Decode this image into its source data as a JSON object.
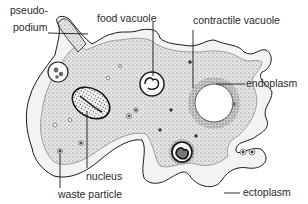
{
  "diagram": {
    "labels": [
      {
        "id": "pseudopodium-1",
        "text": "pseudo-"
      },
      {
        "id": "pseudopodium-2",
        "text": "podium"
      },
      {
        "id": "food-vacuole",
        "text": "food vacuole"
      },
      {
        "id": "contractile-vacuole",
        "text": "contractile vacuole"
      },
      {
        "id": "endoplasm",
        "text": "endoplasm"
      },
      {
        "id": "nucleus",
        "text": "nucleus"
      },
      {
        "id": "waste-particle",
        "text": "waste particle"
      },
      {
        "id": "ectoplasm",
        "text": "ectoplasm"
      }
    ],
    "colors": {
      "ink": "#1a1a1a",
      "label": "#2a2a2a",
      "ectoplasm_fill": "#f4f4f4",
      "endoplasm_fill": "#d9d9d9",
      "background": "#ffffff"
    }
  }
}
